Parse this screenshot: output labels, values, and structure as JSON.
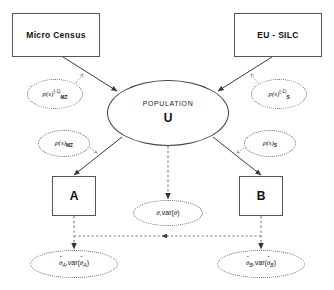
{
  "diagram": {
    "colors": {
      "box_border": "#555555",
      "ellipse_border": "#3f3f3f",
      "dotted_border": "#6b6b6b",
      "solid_edge": "#3a3a3a",
      "dotted_edge": "#7a7a7a",
      "text": "#111111",
      "background": "#ffffff"
    },
    "sources": {
      "micro_census": "Micro Census",
      "eu_silc": "EU - SILC"
    },
    "population": {
      "label": "POPULATION",
      "symbol": "U"
    },
    "estimators": {
      "a": "A",
      "b": "B"
    },
    "weights": {
      "inverse_mz": {
        "base": "p(s)",
        "superscript": "(-1)",
        "subscript": "MZ"
      },
      "inverse_s": {
        "base": "p(s)",
        "superscript": "(-1)",
        "subscript": "S"
      },
      "direct_mz": {
        "base": "p(s)",
        "subscript": "MZ"
      },
      "direct_s": {
        "base": "p(s)",
        "subscript": "S"
      }
    },
    "outputs": {
      "population_estimate": {
        "theta": "θ",
        "var": "var",
        "arg": "θ"
      },
      "estimate_a": {
        "theta": "θ",
        "var": "var",
        "subscript": "A"
      },
      "estimate_b": {
        "theta": "θ",
        "var": "var",
        "subscript": "B"
      }
    }
  }
}
